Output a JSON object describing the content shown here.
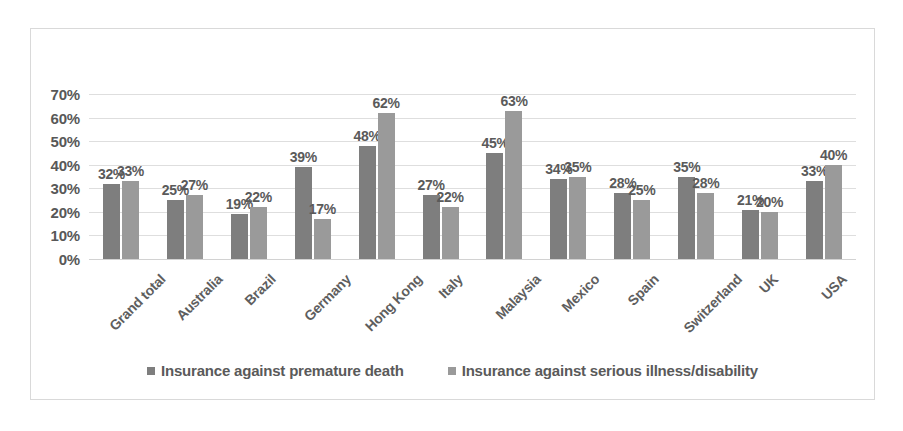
{
  "chart_data": {
    "type": "bar",
    "title": "",
    "subtitle": "",
    "xlabel": "",
    "ylabel": "",
    "ylim": [
      0,
      70
    ],
    "ytick_labels": [
      "70%",
      "60%",
      "50%",
      "40%",
      "30%",
      "20%",
      "10%",
      "0%"
    ],
    "ytick_values": [
      70,
      60,
      50,
      40,
      30,
      20,
      10,
      0
    ],
    "grid": true,
    "legend_position": "bottom",
    "value_suffix": "%",
    "categories": [
      "Grand total",
      "Australia",
      "Brazil",
      "Germany",
      "Hong Kong",
      "Italy",
      "Malaysia",
      "Mexico",
      "Spain",
      "Switzerland",
      "UK",
      "USA"
    ],
    "series": [
      {
        "name": "Insurance against premature death",
        "color": "#7e7e7e",
        "values": [
          32,
          25,
          19,
          39,
          48,
          27,
          45,
          34,
          28,
          35,
          21,
          33
        ],
        "labels": [
          "32%",
          "25%",
          "19%",
          "39%",
          "48%",
          "27%",
          "45%",
          "34%",
          "28%",
          "35%",
          "21%",
          "33%"
        ]
      },
      {
        "name": "Insurance against serious illness/disability",
        "color": "#9a9a9a",
        "values": [
          33,
          27,
          22,
          17,
          62,
          22,
          63,
          35,
          25,
          28,
          20,
          40
        ],
        "labels": [
          "33%",
          "27%",
          "22%",
          "17%",
          "62%",
          "22%",
          "63%",
          "35%",
          "25%",
          "28%",
          "20%",
          "40%"
        ]
      }
    ]
  },
  "legend": {
    "items": [
      {
        "label": "Insurance against premature death",
        "marker": "square-marker"
      },
      {
        "label": "Insurance against serious illness/disability",
        "marker": "square-marker"
      }
    ]
  },
  "colors": {
    "series1": "#7e7e7e",
    "series2": "#9a9a9a",
    "gridline": "#dedede",
    "border": "#d9d9d9",
    "text": "#5a5a5a",
    "background": "#ffffff"
  }
}
